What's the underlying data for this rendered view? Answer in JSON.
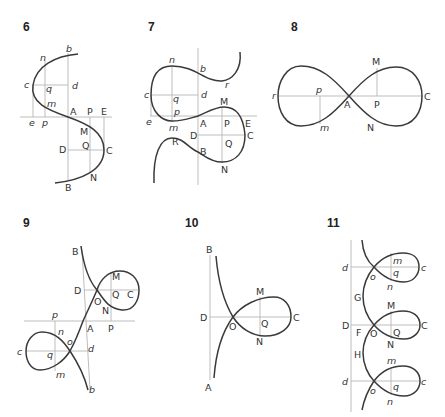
{
  "figures": [
    {
      "number": "6",
      "labels": {
        "b": "b",
        "n": "n",
        "c": "c",
        "q": "q",
        "d": "d",
        "m": "m",
        "e": "e",
        "p": "p",
        "A": "A",
        "P": "P",
        "E": "E",
        "M": "M",
        "Q": "Q",
        "D": "D",
        "C": "C",
        "N": "N",
        "B": "B"
      }
    },
    {
      "number": "7",
      "labels": {
        "n": "n",
        "b": "b",
        "r": "r",
        "c": "c",
        "q": "q",
        "d": "d",
        "M": "M",
        "p": "p",
        "e": "e",
        "m": "m",
        "A": "A",
        "P": "P",
        "E": "E",
        "D": "D",
        "C": "C",
        "R": "R",
        "Q": "Q",
        "B": "B",
        "N": "N"
      }
    },
    {
      "number": "8",
      "labels": {
        "M": "M",
        "r": "r",
        "p": "p",
        "A": "A",
        "P": "P",
        "C": "C",
        "m": "m",
        "N": "N"
      }
    },
    {
      "number": "9",
      "labels": {
        "B": "B",
        "M": "M",
        "D": "D",
        "O": "O",
        "Q": "Q",
        "C": "C",
        "N": "N",
        "p": "p",
        "A": "A",
        "P": "P",
        "n": "n",
        "o": "o",
        "c": "c",
        "q": "q",
        "d": "d",
        "m": "m",
        "b": "b"
      }
    },
    {
      "number": "10",
      "labels": {
        "B": "B",
        "M": "M",
        "D": "D",
        "O": "O",
        "Q": "Q",
        "C": "C",
        "N": "N",
        "A": "A"
      }
    },
    {
      "number": "11",
      "labels": {
        "d1": "d",
        "m1": "m",
        "c1": "c",
        "o1": "o",
        "q1": "q",
        "n1": "n",
        "G": "G",
        "M": "M",
        "D": "D",
        "F": "F",
        "O": "O",
        "Q": "Q",
        "C": "C",
        "N": "N",
        "H": "H",
        "m2": "m",
        "d2": "d",
        "c2": "c",
        "o2": "o",
        "q2": "q",
        "n2": "n"
      }
    }
  ]
}
